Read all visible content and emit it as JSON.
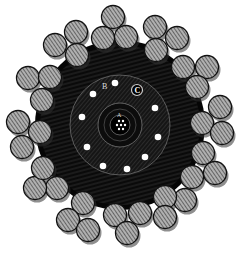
{
  "figure": {
    "labels": {
      "a": "A",
      "b": "B",
      "c": "C"
    },
    "colors": {
      "background": "#ffffff",
      "sheath": "#0a0a0a",
      "hatch": "#5a5a5a",
      "wire_fill": "#9a9a9a",
      "wire_hatch": "#3a3a3a",
      "wire_outline": "#111111",
      "core_dot": "#ffffff"
    },
    "armor_wires": [
      {
        "x": 113,
        "y": 17
      },
      {
        "x": 76,
        "y": 32
      },
      {
        "x": 55,
        "y": 45
      },
      {
        "x": 77,
        "y": 55
      },
      {
        "x": 103,
        "y": 38
      },
      {
        "x": 126,
        "y": 37
      },
      {
        "x": 155,
        "y": 27
      },
      {
        "x": 177,
        "y": 38
      },
      {
        "x": 156,
        "y": 50
      },
      {
        "x": 183,
        "y": 67
      },
      {
        "x": 207,
        "y": 67
      },
      {
        "x": 197,
        "y": 87
      },
      {
        "x": 220,
        "y": 107
      },
      {
        "x": 202,
        "y": 123
      },
      {
        "x": 222,
        "y": 133
      },
      {
        "x": 203,
        "y": 153
      },
      {
        "x": 215,
        "y": 173
      },
      {
        "x": 192,
        "y": 177
      },
      {
        "x": 185,
        "y": 200
      },
      {
        "x": 165,
        "y": 197
      },
      {
        "x": 165,
        "y": 217
      },
      {
        "x": 140,
        "y": 213
      },
      {
        "x": 115,
        "y": 215
      },
      {
        "x": 127,
        "y": 233
      },
      {
        "x": 83,
        "y": 203
      },
      {
        "x": 68,
        "y": 220
      },
      {
        "x": 88,
        "y": 230
      },
      {
        "x": 57,
        "y": 188
      },
      {
        "x": 35,
        "y": 188
      },
      {
        "x": 43,
        "y": 168
      },
      {
        "x": 22,
        "y": 147
      },
      {
        "x": 40,
        "y": 132
      },
      {
        "x": 18,
        "y": 122
      },
      {
        "x": 42,
        "y": 100
      },
      {
        "x": 28,
        "y": 78
      },
      {
        "x": 50,
        "y": 77
      }
    ],
    "inner_dots": [
      {
        "x": 115,
        "y": 83
      },
      {
        "x": 93,
        "y": 94
      },
      {
        "x": 155,
        "y": 108
      },
      {
        "x": 82,
        "y": 117
      },
      {
        "x": 158,
        "y": 137
      },
      {
        "x": 87,
        "y": 147
      },
      {
        "x": 145,
        "y": 157
      },
      {
        "x": 103,
        "y": 166
      },
      {
        "x": 127,
        "y": 169
      }
    ],
    "core_strands": [
      {
        "x": 119,
        "y": 121
      },
      {
        "x": 123,
        "y": 121
      },
      {
        "x": 117,
        "y": 125
      },
      {
        "x": 121,
        "y": 125
      },
      {
        "x": 125,
        "y": 125
      },
      {
        "x": 119,
        "y": 129
      },
      {
        "x": 123,
        "y": 129
      }
    ]
  }
}
